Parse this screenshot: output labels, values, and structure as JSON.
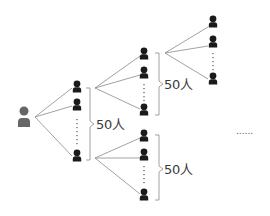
{
  "diagram": {
    "type": "referral-tree",
    "root": {
      "label": "person",
      "color": "#666666"
    },
    "node_color": "#1a1a1a",
    "line_color": "#888888",
    "groups": [
      {
        "id": "level1",
        "count_label": "50人"
      },
      {
        "id": "level2a",
        "count_label": "50人"
      },
      {
        "id": "level2b",
        "count_label": "50人"
      }
    ],
    "continuation": "......"
  }
}
